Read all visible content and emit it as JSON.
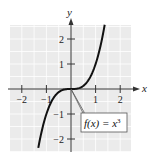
{
  "chart_data": {
    "type": "line",
    "title": "",
    "xlabel": "x",
    "ylabel": "y",
    "xlim": [
      -2.5,
      2.5
    ],
    "ylim": [
      -2.5,
      2.5
    ],
    "grid": true,
    "x_ticks": [
      -2,
      -1,
      1,
      2
    ],
    "y_ticks": [
      -2,
      -1,
      1,
      2
    ],
    "x_tick_labels": [
      "−2",
      "−1",
      "1",
      "2"
    ],
    "y_tick_labels": [
      "−2",
      "−1",
      "1",
      "2"
    ],
    "series": [
      {
        "name": "f(x) = x^3",
        "function": "x^3",
        "x_range": [
          -1.33,
          1.37
        ],
        "x": [
          -1.33,
          -1.2,
          -1.0,
          -0.8,
          -0.6,
          -0.4,
          -0.2,
          0,
          0.2,
          0.4,
          0.6,
          0.8,
          1.0,
          1.2,
          1.37
        ],
        "values": [
          -2.35,
          -1.73,
          -1.0,
          -0.51,
          -0.22,
          -0.06,
          -0.01,
          0,
          0.01,
          0.06,
          0.22,
          0.51,
          1.0,
          1.73,
          2.57
        ]
      }
    ],
    "annotations": [
      {
        "text_main": "f(x) = x",
        "superscript": "3",
        "points_to": [
          0,
          0
        ]
      }
    ],
    "colors": {
      "background": "#ebebeb",
      "grid": "#ffffff",
      "curve": "#111111",
      "axis": "#333333"
    }
  }
}
